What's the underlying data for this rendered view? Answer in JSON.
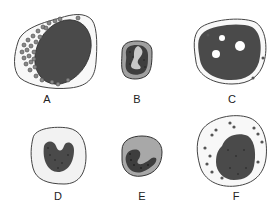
{
  "figure": {
    "cells": [
      {
        "id": "A",
        "label": "A",
        "description": "large cell with oval dark nucleus and many cytoplasmic granules"
      },
      {
        "id": "B",
        "label": "B",
        "description": "small round cell with dark lobed nucleus and pale cleft"
      },
      {
        "id": "C",
        "label": "C",
        "description": "cell with large dark nucleus containing pale nucleoli"
      },
      {
        "id": "D",
        "label": "D",
        "description": "cell with pale cytoplasm and kidney-shaped stippled nucleus"
      },
      {
        "id": "E",
        "label": "E",
        "description": "cell with gray cytoplasm and C-shaped stippled nucleus"
      },
      {
        "id": "F",
        "label": "F",
        "description": "round cell with dark stippled nucleus and scattered granules"
      }
    ],
    "colors": {
      "outline": "#444444",
      "nucleus": "#4a4a4a",
      "cytoplasm_light": "#f2f2f2",
      "cytoplasm_gray": "#a8a8a8",
      "granule": "#555555"
    }
  }
}
